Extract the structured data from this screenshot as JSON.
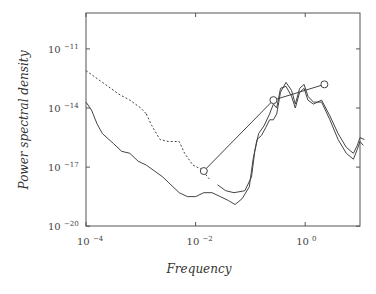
{
  "chart_data": {
    "type": "line",
    "title": "",
    "xlabel": "Frequency",
    "ylabel": "Power spectral density",
    "xscale": "log",
    "yscale": "log",
    "xlim_log10": [
      -4,
      1
    ],
    "ylim_log10": [
      -20,
      -9.2
    ],
    "grid": false,
    "legend": null,
    "x_ticks": [
      {
        "base": "10",
        "exp": "-4",
        "log10": -4
      },
      {
        "base": "10",
        "exp": "-2",
        "log10": -2
      },
      {
        "base": "10",
        "exp": "0",
        "log10": 0
      }
    ],
    "y_ticks": [
      {
        "base": "10",
        "exp": "-11",
        "log10": -11
      },
      {
        "base": "10",
        "exp": "-14",
        "log10": -14
      },
      {
        "base": "10",
        "exp": "-17",
        "log10": -17
      },
      {
        "base": "10",
        "exp": "-20",
        "log10": -20
      }
    ],
    "series": [
      {
        "name": "upper spectrum (dashed at low frequency)",
        "style": "dashed-then-solid",
        "dash_until_log10f": -1.7,
        "points_log10": [
          [
            -4.0,
            -12.1
          ],
          [
            -3.8,
            -12.5
          ],
          [
            -3.6,
            -12.9
          ],
          [
            -3.4,
            -13.3
          ],
          [
            -3.2,
            -13.6
          ],
          [
            -3.0,
            -14.0
          ],
          [
            -2.9,
            -14.3
          ],
          [
            -2.8,
            -14.9
          ],
          [
            -2.65,
            -15.6
          ],
          [
            -2.5,
            -15.7
          ],
          [
            -2.3,
            -15.7
          ],
          [
            -2.2,
            -16.3
          ],
          [
            -2.05,
            -16.9
          ],
          [
            -1.9,
            -17.1
          ],
          [
            -1.75,
            -17.6
          ],
          [
            -1.6,
            -17.9
          ],
          [
            -1.45,
            -18.2
          ],
          [
            -1.3,
            -18.3
          ],
          [
            -1.1,
            -18.2
          ],
          [
            -0.98,
            -17.5
          ],
          [
            -0.92,
            -16.2
          ],
          [
            -0.85,
            -15.3
          ],
          [
            -0.75,
            -14.9
          ],
          [
            -0.65,
            -14.3
          ],
          [
            -0.58,
            -13.8
          ],
          [
            -0.52,
            -14.0
          ],
          [
            -0.45,
            -13.0
          ],
          [
            -0.35,
            -12.9
          ],
          [
            -0.25,
            -13.4
          ],
          [
            -0.18,
            -14.0
          ],
          [
            -0.1,
            -13.2
          ],
          [
            -0.02,
            -13.0
          ],
          [
            0.05,
            -13.6
          ],
          [
            0.15,
            -13.8
          ],
          [
            0.3,
            -13.6
          ],
          [
            0.45,
            -14.4
          ],
          [
            0.6,
            -15.3
          ],
          [
            0.75,
            -16.0
          ],
          [
            0.88,
            -16.3
          ],
          [
            0.95,
            -15.9
          ],
          [
            1.0,
            -15.5
          ],
          [
            1.08,
            -15.6
          ]
        ]
      },
      {
        "name": "lower spectrum",
        "style": "solid",
        "points_log10": [
          [
            -4.0,
            -13.7
          ],
          [
            -3.9,
            -14.1
          ],
          [
            -3.8,
            -14.8
          ],
          [
            -3.7,
            -15.3
          ],
          [
            -3.5,
            -15.8
          ],
          [
            -3.35,
            -16.2
          ],
          [
            -3.2,
            -16.3
          ],
          [
            -3.05,
            -16.7
          ],
          [
            -2.9,
            -16.9
          ],
          [
            -2.75,
            -17.2
          ],
          [
            -2.6,
            -17.5
          ],
          [
            -2.45,
            -17.9
          ],
          [
            -2.3,
            -18.3
          ],
          [
            -2.15,
            -18.5
          ],
          [
            -2.0,
            -18.5
          ],
          [
            -1.85,
            -18.3
          ],
          [
            -1.7,
            -18.3
          ],
          [
            -1.55,
            -18.5
          ],
          [
            -1.4,
            -18.7
          ],
          [
            -1.28,
            -18.9
          ],
          [
            -1.15,
            -18.6
          ],
          [
            -1.02,
            -18.0
          ],
          [
            -0.95,
            -16.6
          ],
          [
            -0.88,
            -15.6
          ],
          [
            -0.8,
            -15.4
          ],
          [
            -0.72,
            -15.0
          ],
          [
            -0.65,
            -14.6
          ],
          [
            -0.58,
            -14.6
          ],
          [
            -0.52,
            -14.3
          ],
          [
            -0.45,
            -13.2
          ],
          [
            -0.35,
            -12.7
          ],
          [
            -0.25,
            -13.1
          ],
          [
            -0.18,
            -13.8
          ],
          [
            -0.1,
            -13.0
          ],
          [
            -0.02,
            -12.8
          ],
          [
            0.05,
            -13.4
          ],
          [
            0.15,
            -13.7
          ],
          [
            0.3,
            -13.7
          ],
          [
            0.45,
            -14.6
          ],
          [
            0.6,
            -15.6
          ],
          [
            0.75,
            -16.3
          ],
          [
            0.88,
            -16.6
          ],
          [
            0.95,
            -16.1
          ],
          [
            1.0,
            -15.7
          ],
          [
            1.06,
            -15.9
          ]
        ]
      },
      {
        "name": "circle markers",
        "style": "solid-with-open-circles",
        "points_log10": [
          [
            -1.85,
            -17.2
          ],
          [
            -0.58,
            -13.6
          ],
          [
            0.35,
            -12.8
          ]
        ]
      }
    ]
  }
}
